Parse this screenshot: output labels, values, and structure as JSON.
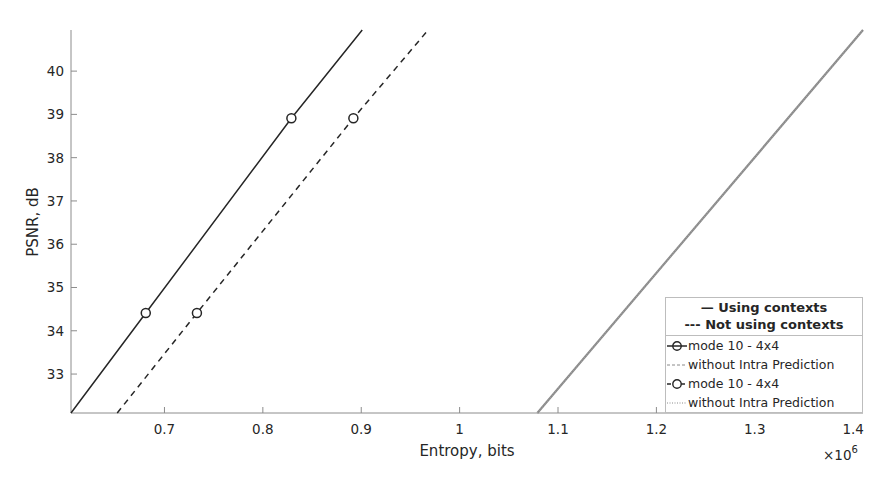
{
  "chart_data": {
    "type": "line",
    "title": "",
    "xlabel": "Entropy, bits",
    "ylabel": "PSNR, dB",
    "x_multiplier": "×10^6",
    "xlim": [
      0.605,
      1.41
    ],
    "ylim": [
      32.1,
      40.95
    ],
    "xticks": [
      0.7,
      0.8,
      0.9,
      1,
      1.1,
      1.2,
      1.3,
      1.4
    ],
    "xtick_labels": [
      "0.7",
      "0.8",
      "0.9",
      "1",
      "1.1",
      "1.2",
      "1.3",
      "1.4"
    ],
    "yticks": [
      33,
      34,
      35,
      36,
      37,
      38,
      39,
      40
    ],
    "ytick_labels": [
      "33",
      "34",
      "35",
      "36",
      "37",
      "38",
      "39",
      "40"
    ],
    "grid": false,
    "legend_position": "lower right",
    "legend_header": [
      "— Using contexts",
      "--- Not using contexts"
    ],
    "series": [
      {
        "name": "mode 10 - 4x4 (using contexts)",
        "style": "solid",
        "marker": "o",
        "color": "#262626",
        "x": [
          0.605,
          0.681,
          0.829,
          0.901
        ],
        "y": [
          32.1,
          34.41,
          38.91,
          40.95
        ],
        "markers_x": [
          0.681,
          0.829
        ],
        "markers_y": [
          34.41,
          38.91
        ]
      },
      {
        "name": "without Intra Prediction (using contexts)",
        "style": "solid",
        "marker": "",
        "color": "#8a8a8a",
        "x": [
          1.079,
          1.41
        ],
        "y": [
          32.1,
          40.95
        ]
      },
      {
        "name": "mode 10 - 4x4 (not using contexts)",
        "style": "dashed",
        "marker": "o",
        "color": "#262626",
        "x": [
          0.652,
          0.733,
          0.892,
          0.968
        ],
        "y": [
          32.1,
          34.41,
          38.91,
          40.95
        ],
        "markers_x": [
          0.733,
          0.892
        ],
        "markers_y": [
          34.41,
          38.91
        ]
      },
      {
        "name": "without Intra Prediction (not using contexts)",
        "style": "dotted",
        "marker": "",
        "color": "#8a8a8a",
        "x": [
          1.079,
          1.41
        ],
        "y": [
          32.1,
          40.95
        ]
      }
    ]
  },
  "legend": {
    "header_line1": "— Using contexts",
    "header_line2": "--- Not using contexts",
    "entries": [
      {
        "label": "mode 10 - 4x4",
        "style": "solid-marker"
      },
      {
        "label": "without Intra Prediction",
        "style": "gray-dash"
      },
      {
        "label": "mode 10 - 4x4",
        "style": "dashed-marker"
      },
      {
        "label": "without Intra Prediction",
        "style": "gray-dot"
      }
    ]
  },
  "axes": {
    "xlabel": "Entropy, bits",
    "ylabel": "PSNR, dB",
    "x_multiplier_base": "×10",
    "x_multiplier_exp": "6"
  }
}
